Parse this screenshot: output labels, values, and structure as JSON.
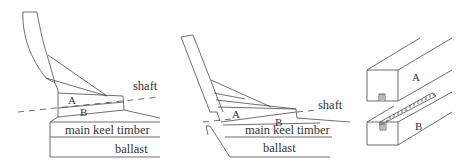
{
  "diagram": {
    "panels": [
      {
        "id": "left-section",
        "labels": {
          "shaft": "shaft",
          "a": "A",
          "b": "B",
          "main_keel_timber": "main keel timber",
          "ballast": "ballast"
        }
      },
      {
        "id": "middle-section",
        "labels": {
          "shaft": "shaft",
          "a": "A",
          "b": "B",
          "main_keel_timber": "main keel timber",
          "ballast": "ballast"
        }
      },
      {
        "id": "joint-detail",
        "labels": {
          "a": "A",
          "b": "B"
        }
      }
    ],
    "line_color": "#4a4a4a",
    "text_color": "#333333",
    "background": "#ffffff"
  }
}
